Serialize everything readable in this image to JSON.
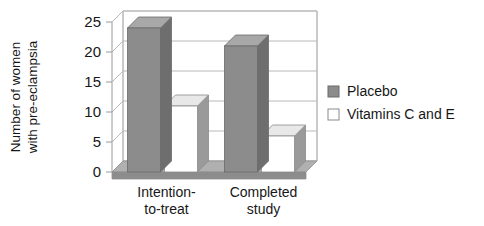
{
  "chart_data": {
    "type": "bar",
    "title": "",
    "subtitle": "",
    "xlabel": "",
    "ylabel": "Number of women with pre-eclampsia",
    "ylabel_line1": "Number of women",
    "ylabel_line2": "with pre-eclampsia",
    "categories": [
      "Intention-to-treat",
      "Completed study"
    ],
    "category_lines": [
      [
        "Intention-",
        "to-treat"
      ],
      [
        "Completed",
        "study"
      ]
    ],
    "series": [
      {
        "name": "Placebo",
        "values": [
          24,
          21
        ],
        "color": "#8c8c8c"
      },
      {
        "name": "Vitamins C and E",
        "values": [
          11,
          6
        ],
        "color": "#ffffff"
      }
    ],
    "ylim": [
      0,
      25
    ],
    "yticks": [
      0,
      5,
      10,
      15,
      20,
      25
    ],
    "ytick_labels": [
      "0",
      "5",
      "10",
      "15",
      "20",
      "25"
    ],
    "grid": true,
    "grid_axis": "y",
    "legend_position": "right",
    "style": "3d-column"
  },
  "legend": {
    "entries": [
      {
        "label": "Placebo",
        "swatch": "filled-gray-square",
        "color": "#8c8c8c"
      },
      {
        "label": "Vitamins C and E",
        "swatch": "outlined-white-square",
        "color": "#ffffff"
      }
    ]
  },
  "colors": {
    "bar_front_gray": "#8c8c8c",
    "bar_top_gray": "#a8a8a8",
    "bar_side_gray": "#6e6e6e",
    "bar_front_white": "#ffffff",
    "bar_top_white": "#e8e8e8",
    "bar_side_white": "#9a9a9a",
    "floor": "#b0b0b0",
    "floor_front": "#8c8c8c",
    "axis_line": "#9a9a9a",
    "grid_line": "#b8b8b8",
    "text": "#171717"
  }
}
